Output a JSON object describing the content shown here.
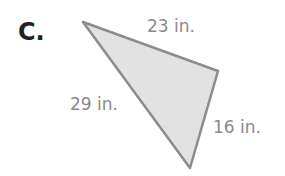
{
  "problem": {
    "letter": "C.",
    "shape": "triangle",
    "sides": [
      {
        "label": "23 in.",
        "position": "top"
      },
      {
        "label": "29 in.",
        "position": "left"
      },
      {
        "label": "16 in.",
        "position": "right"
      }
    ],
    "colors": {
      "fill": "#e2e2e2",
      "stroke": "#8c8c8c",
      "text": "#8a8a8a",
      "letter": "#231f20"
    }
  }
}
